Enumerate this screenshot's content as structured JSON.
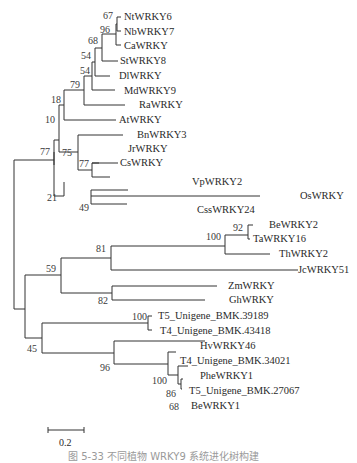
{
  "figure": {
    "type": "phylogenetic-tree",
    "caption": "图 5-33  不同植物 WRKY9 系统进化树构建",
    "scale_bar": {
      "label": "0.2"
    }
  },
  "taxa": [
    {
      "id": "t1",
      "label": "NtWRKY6"
    },
    {
      "id": "t2",
      "label": "NbWRKY7"
    },
    {
      "id": "t3",
      "label": "CaWRKY"
    },
    {
      "id": "t4",
      "label": "StWRKY8"
    },
    {
      "id": "t5",
      "label": "DlWRKY"
    },
    {
      "id": "t6",
      "label": "MdWRKY9"
    },
    {
      "id": "t7",
      "label": "RaWRKY"
    },
    {
      "id": "t8",
      "label": "AtWRKY"
    },
    {
      "id": "t9",
      "label": "BnWRKY3"
    },
    {
      "id": "t10",
      "label": "JrWRKY"
    },
    {
      "id": "t11",
      "label": "CsWRKY"
    },
    {
      "id": "t12",
      "label": "VpWRKY2"
    },
    {
      "id": "t13",
      "label": "OsWRKY"
    },
    {
      "id": "t14",
      "label": "CssWRKY24"
    },
    {
      "id": "t15",
      "label": "BeWRKY2"
    },
    {
      "id": "t16",
      "label": "TaWRKY16"
    },
    {
      "id": "t17",
      "label": "ThWRKY2"
    },
    {
      "id": "t18",
      "label": "JcWRKY51"
    },
    {
      "id": "t19",
      "label": "ZmWRKY"
    },
    {
      "id": "t20",
      "label": "GhWRKY"
    },
    {
      "id": "t21",
      "label": "T5_Unigene_BMK.39189"
    },
    {
      "id": "t22",
      "label": "T4_Unigene_BMK.43418"
    },
    {
      "id": "t23",
      "label": "HvWRKY46"
    },
    {
      "id": "t24",
      "label": "T4_Unigene_BMK.34021"
    },
    {
      "id": "t25",
      "label": "PheWRKY1"
    },
    {
      "id": "t26",
      "label": "T5_Unigene_BMK.27067"
    },
    {
      "id": "t27",
      "label": "BeWRKY1"
    }
  ],
  "bootstrap": {
    "n_nt_nb": "67",
    "n_ca": "96",
    "n_st": "68",
    "n_dl": "54",
    "n_md": "54",
    "n_ra": "79",
    "n_at": "18",
    "n_root_upper": "10",
    "n_bn": "75",
    "n_jr_cs": "77",
    "n_upper": "77",
    "n_vp_group": "21",
    "n_os_css": "49",
    "n_be_ta": "92",
    "n_th": "100",
    "n_jc": "81",
    "n_zm_gh": "82",
    "n_mid": "59",
    "n_t5_t4": "100",
    "n_lower": "45",
    "n_hv": "96",
    "n_t4_34021": "100",
    "n_t5_27067": "86",
    "n_be1": "68"
  }
}
